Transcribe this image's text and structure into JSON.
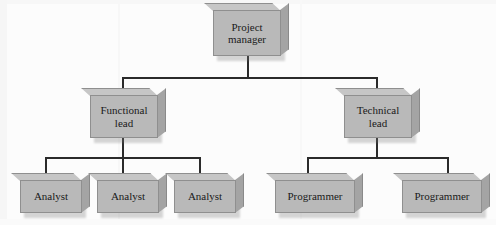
{
  "diagram": {
    "type": "organization-chart",
    "background_color": "#fcfcfc",
    "box_fill_color": "#b9b9b9",
    "box_border_color": "#8f8f8f",
    "connector_color": "#2b2b2b",
    "text_color": "#1a1a1a",
    "levels": 3,
    "nodes": [
      {
        "id": "project-manager",
        "label": "Project\nmanager",
        "line1": "Project",
        "line2": "manager",
        "level": 1,
        "parent": null
      },
      {
        "id": "functional-lead",
        "label": "Functional\nlead",
        "line1": "Functional",
        "line2": "lead",
        "level": 2,
        "parent": "project-manager"
      },
      {
        "id": "technical-lead",
        "label": "Technical\nlead",
        "line1": "Technical",
        "line2": "lead",
        "level": 2,
        "parent": "project-manager"
      },
      {
        "id": "analyst-1",
        "label": "Analyst",
        "line1": "Analyst",
        "line2": "",
        "level": 3,
        "parent": "functional-lead"
      },
      {
        "id": "analyst-2",
        "label": "Analyst",
        "line1": "Analyst",
        "line2": "",
        "level": 3,
        "parent": "functional-lead"
      },
      {
        "id": "analyst-3",
        "label": "Analyst",
        "line1": "Analyst",
        "line2": "",
        "level": 3,
        "parent": "functional-lead"
      },
      {
        "id": "programmer-1",
        "label": "Programmer",
        "line1": "Programmer",
        "line2": "",
        "level": 3,
        "parent": "technical-lead"
      },
      {
        "id": "programmer-2",
        "label": "Programmer",
        "line1": "Programmer",
        "line2": "",
        "level": 3,
        "parent": "technical-lead"
      }
    ]
  }
}
